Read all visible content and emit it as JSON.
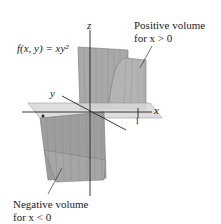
{
  "figure": {
    "function_label": "f(x, y) = xy²",
    "annotations": {
      "positive": {
        "line1": "Positive volume",
        "line2": "for x > 0"
      },
      "negative": {
        "line1": "Negative volume",
        "line2": "for x < 0"
      }
    },
    "axes": {
      "x": "x",
      "y": "y",
      "z": "z"
    },
    "ticks": {
      "x_one": "1",
      "y_neg_one": "−1"
    },
    "colors": {
      "surface": "#a8a8a8",
      "surface_dark": "#8e8e8e",
      "surface_light": "#c4c4c4",
      "plane": "#d6d6d6",
      "axis": "#222222",
      "mesh": "#7a7a7a"
    }
  }
}
